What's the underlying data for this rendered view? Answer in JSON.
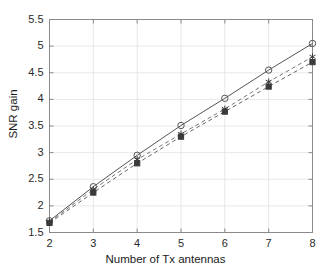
{
  "chart_data": {
    "type": "line",
    "title": "",
    "xlabel": "Number of Tx antennas",
    "ylabel": "SNR gain",
    "x": [
      2,
      3,
      4,
      5,
      6,
      7,
      8
    ],
    "xlim": [
      2,
      8
    ],
    "ylim": [
      1.5,
      5.5
    ],
    "xticks": [
      "2",
      "3",
      "4",
      "5",
      "6",
      "7",
      "8"
    ],
    "yticks": [
      "1.5",
      "2",
      "2.5",
      "3",
      "3.5",
      "4",
      "4.5",
      "5",
      "5.5"
    ],
    "grid": true,
    "legend": "none",
    "series": [
      {
        "name": "series-1",
        "values": [
          1.72,
          2.36,
          2.95,
          3.51,
          4.02,
          4.55,
          5.05
        ],
        "linestyle": "solid",
        "marker": "circle",
        "color": "#555555"
      },
      {
        "name": "series-2",
        "values": [
          1.7,
          2.31,
          2.87,
          3.35,
          3.82,
          4.33,
          4.8
        ],
        "linestyle": "dashed",
        "marker": "asterisk",
        "color": "#777777"
      },
      {
        "name": "series-3",
        "values": [
          1.68,
          2.25,
          2.8,
          3.3,
          3.77,
          4.24,
          4.7
        ],
        "linestyle": "dashed",
        "marker": "square",
        "color": "#666666"
      }
    ]
  },
  "axes": {
    "frame_color": "#8a8a8a",
    "grid_color": "#e2e2e2",
    "background": "#ffffff"
  }
}
